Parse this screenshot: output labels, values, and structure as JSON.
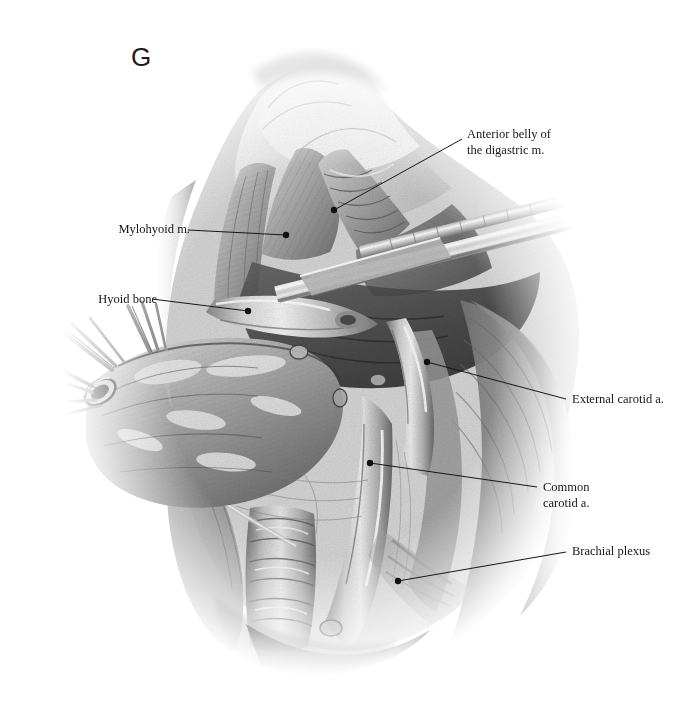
{
  "figure": {
    "panel_letter": "G",
    "type": "anatomical-surgical-illustration",
    "style": "grayscale graphite / wash medical illustration",
    "background_color": "#ffffff",
    "ink_color": "#161616"
  },
  "labels": {
    "digastric": {
      "line1": "Anterior belly of",
      "line2": "the digastric m.",
      "text": "Anterior belly of\nthe digastric m.",
      "side": "right",
      "dot": {
        "x": 334,
        "y": 210
      },
      "elbow": {
        "x": 462,
        "y": 139
      }
    },
    "mylohyoid": {
      "text": "Mylohyoid m.",
      "side": "left",
      "dot": {
        "x": 286,
        "y": 235
      },
      "elbow": {
        "x": 188,
        "y": 230
      }
    },
    "hyoid": {
      "text": "Hyoid bone",
      "side": "left",
      "dot": {
        "x": 248,
        "y": 311
      },
      "elbow": {
        "x": 152,
        "y": 299
      }
    },
    "external_carotid": {
      "text": "External carotid a.",
      "side": "right",
      "dot": {
        "x": 427,
        "y": 362
      },
      "elbow": {
        "x": 566,
        "y": 399
      }
    },
    "common_carotid": {
      "line1": "Common",
      "line2": "carotid a.",
      "text": "Common\ncarotid a.",
      "side": "right",
      "dot": {
        "x": 370,
        "y": 463
      },
      "elbow": {
        "x": 537,
        "y": 487
      }
    },
    "brachial_plexus": {
      "text": "Brachial plexus",
      "side": "right",
      "dot": {
        "x": 398,
        "y": 581
      },
      "elbow": {
        "x": 566,
        "y": 552
      }
    }
  },
  "structures": [
    {
      "name": "chin-and-mandible",
      "note": "upper mass fading to white at top"
    },
    {
      "name": "mylohyoid-muscle",
      "note": "triangular striated sheet, upper left of field"
    },
    {
      "name": "anterior-belly-digastric-muscle",
      "note": "banded strap below mandible"
    },
    {
      "name": "hyoid-bone",
      "note": "transverse pale bar mid-field"
    },
    {
      "name": "surgical-retractor-blade",
      "note": "long pale instrument crossing diagonally upper right"
    },
    {
      "name": "resected-gland-specimen",
      "note": "lobulated mass retracted to the left"
    },
    {
      "name": "suture-threads",
      "note": "fine strands extending to far left"
    },
    {
      "name": "vessel-clamp-ring",
      "note": "small oval clamp on specimen"
    },
    {
      "name": "external-carotid-artery",
      "note": "pale tubular vessel right of midline"
    },
    {
      "name": "common-carotid-artery",
      "note": "large vertical vessel running inferiorly"
    },
    {
      "name": "internal-jugular-vein",
      "note": "broad vessel lateral to carotid"
    },
    {
      "name": "brachial-plexus",
      "note": "fibrous cords low lateral field"
    },
    {
      "name": "trachea",
      "note": "ringed cartilaginous tube, bottom centre"
    },
    {
      "name": "sternocleidomastoid-muscle",
      "note": "large shaded muscle on right, feathering to white"
    }
  ]
}
